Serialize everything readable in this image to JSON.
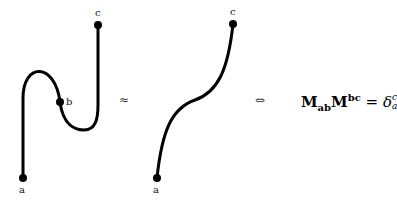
{
  "diagram": {
    "left_figure": {
      "labels": {
        "a": "a",
        "b": "b",
        "c": "c"
      }
    },
    "approx_symbol": "≈",
    "right_figure": {
      "labels": {
        "a": "a",
        "c": "c"
      }
    },
    "iff_symbol": "⇔",
    "equation": {
      "M1": "M",
      "M1_sub": "ab",
      "M2": "M",
      "M2_sup": "bc",
      "equals": "=",
      "delta": "δ",
      "delta_sup": "c",
      "delta_sub": "a"
    },
    "colors": {
      "stroke": "#000000",
      "background": "#ffffff"
    }
  }
}
